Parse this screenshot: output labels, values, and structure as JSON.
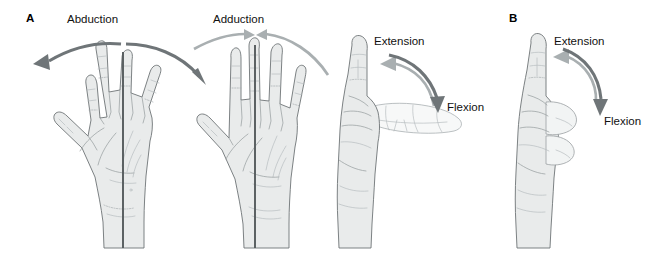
{
  "figure": {
    "width": 660,
    "height": 254,
    "background": "#ffffff"
  },
  "colors": {
    "arrow_dark": "#6f7578",
    "arrow_light": "#a9afb1",
    "hand_fill": "#e9ebeb",
    "hand_outline": "#6e7476",
    "axis_line": "#555b5d",
    "text": "#111111"
  },
  "panels": [
    {
      "id": "A",
      "letter": "A",
      "views": [
        {
          "name": "abduction-view",
          "label": "Abduction",
          "arrows": [
            {
              "name": "abduction-arrow-left",
              "direction": "left",
              "tone": "dark"
            },
            {
              "name": "abduction-arrow-right",
              "direction": "right",
              "tone": "dark"
            }
          ]
        },
        {
          "name": "adduction-view",
          "label": "Adduction",
          "arrows": [
            {
              "name": "adduction-arrow-left",
              "direction": "inward-right",
              "tone": "light"
            },
            {
              "name": "adduction-arrow-right",
              "direction": "inward-left",
              "tone": "light"
            }
          ]
        },
        {
          "name": "extension-flexion-view",
          "labels": [
            "Extension",
            "Flexion"
          ],
          "label_extension": "Extension",
          "label_flexion": "Flexion",
          "arrows": [
            {
              "name": "extension-arrow",
              "direction": "up-left",
              "tone": "light"
            },
            {
              "name": "flexion-arrow",
              "direction": "down-right",
              "tone": "dark"
            }
          ]
        }
      ]
    },
    {
      "id": "B",
      "letter": "B",
      "views": [
        {
          "name": "extension-flexion-view",
          "labels": [
            "Extension",
            "Flexion"
          ],
          "label_extension": "Extension",
          "label_flexion": "Flexion",
          "arrows": [
            {
              "name": "extension-arrow",
              "direction": "up-left",
              "tone": "light"
            },
            {
              "name": "flexion-arrow",
              "direction": "down-right",
              "tone": "dark"
            }
          ]
        }
      ]
    }
  ],
  "labels": {
    "panel_a": "A",
    "panel_b": "B",
    "abduction": "Abduction",
    "adduction": "Adduction",
    "extension_a": "Extension",
    "flexion_a": "Flexion",
    "extension_b": "Extension",
    "flexion_b": "Flexion"
  }
}
